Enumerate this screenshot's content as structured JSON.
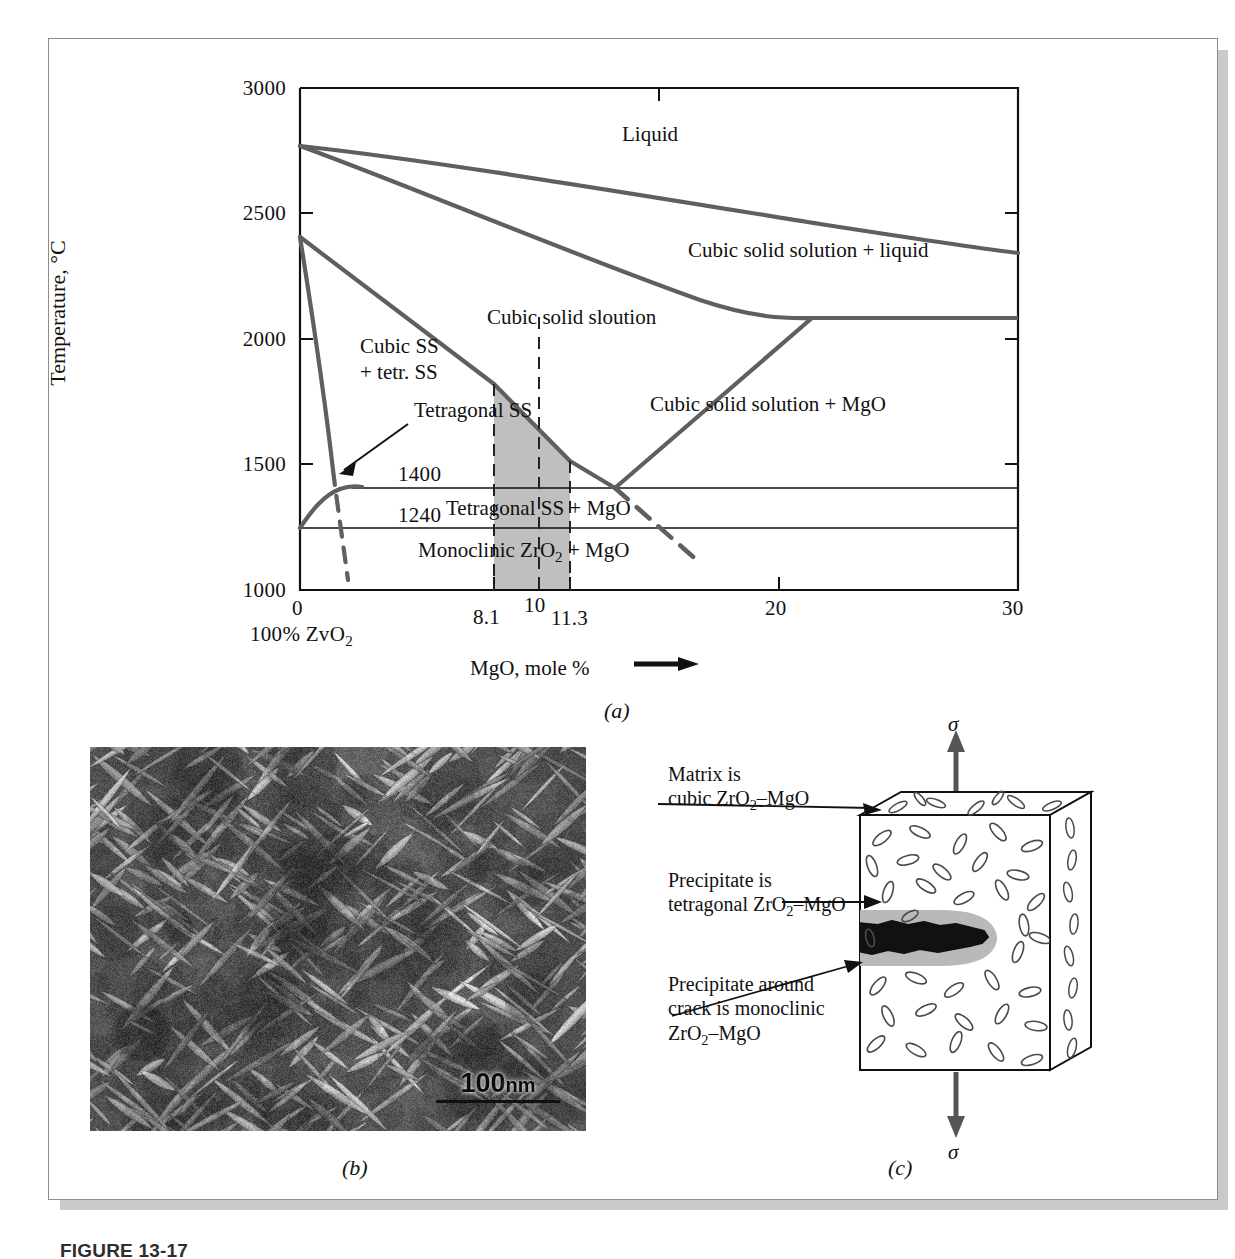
{
  "figure": {
    "caption_number": "FIGURE 13-17",
    "panel_tags": {
      "a": "(a)",
      "b": "(b)",
      "c": "(c)"
    }
  },
  "panel_a": {
    "name": "ZrO2-MgO phase diagram",
    "y_axis": {
      "title": "Temperature, °C",
      "ticks": [
        "3000",
        "2500",
        "2000",
        "1500",
        "1000"
      ],
      "min": 1000,
      "max": 3000
    },
    "x_axis": {
      "title": "MgO, mole %",
      "title_arrow": "⟶",
      "ticks": [
        "0",
        "8.1",
        "10",
        "11.3",
        "20",
        "30"
      ],
      "min": 0,
      "max": 30,
      "origin_note": "100% ZvO",
      "origin_note_sub": "2"
    },
    "horizontal_lines": [
      {
        "label": "1400",
        "temperature": 1400
      },
      {
        "label": "1240",
        "temperature": 1240
      }
    ],
    "field_labels": [
      "Liquid",
      "Cubic solid solution + liquid",
      "Cubic solid sloution",
      "Cubic SS",
      "+ tetr. SS",
      "Tetragonal SS",
      "Cubic solid solution + MgO",
      "Tetragonal SS + MgO"
    ],
    "monoclinic_label": {
      "pre": "Monoclinic ZrO",
      "sub": "2",
      "post": " + MgO"
    }
  },
  "chart_data": {
    "type": "line",
    "xlabel": "MgO, mole %",
    "ylabel": "Temperature, °C",
    "xlim": [
      0,
      30
    ],
    "ylim": [
      1000,
      3000
    ],
    "xticks": [
      0,
      8.1,
      10,
      11.3,
      20,
      30
    ],
    "yticks": [
      1000,
      1500,
      2000,
      2500,
      3000
    ],
    "grid": false,
    "legend": "none",
    "shaded_region": {
      "x_from": 8.1,
      "x_to": 11.3,
      "y_from": 1000,
      "color": "#bfbfbf"
    },
    "series": [
      {
        "name": "liquidus",
        "points": [
          [
            0,
            2770
          ],
          [
            8,
            2690
          ],
          [
            16,
            2570
          ],
          [
            23,
            2460
          ],
          [
            30,
            2390
          ]
        ]
      },
      {
        "name": "solidus (cubic ss + liquid)",
        "points": [
          [
            0,
            2770
          ],
          [
            7,
            2560
          ],
          [
            14,
            2330
          ],
          [
            21.4,
            2090
          ]
        ]
      },
      {
        "name": "eutectic horizontal 2090",
        "points": [
          [
            21.4,
            2090
          ],
          [
            30,
            2090
          ]
        ]
      },
      {
        "name": "cubic ss + MgO boundary",
        "points": [
          [
            21.4,
            2090
          ],
          [
            13.2,
            1400
          ]
        ]
      },
      {
        "name": "cubic solvus (tetragonal boundary)",
        "points": [
          [
            0,
            2370
          ],
          [
            4,
            2140
          ],
          [
            8.1,
            1790
          ],
          [
            11.3,
            1530
          ],
          [
            13.2,
            1400
          ]
        ]
      },
      {
        "name": "tetragonal/monoclinic dashed boundary",
        "points": [
          [
            0.9,
            2370
          ],
          [
            2.0,
            1530
          ],
          [
            2.6,
            1100
          ]
        ],
        "style": "dashed-lower"
      },
      {
        "name": "monoclinic dome",
        "points": [
          [
            0,
            1240
          ],
          [
            0.7,
            1330
          ],
          [
            1.5,
            1390
          ],
          [
            2.2,
            1400
          ]
        ]
      },
      {
        "name": "dashed boundary below eutectoid",
        "points": [
          [
            13.2,
            1400
          ],
          [
            16.4,
            1100
          ]
        ],
        "style": "dashed"
      },
      {
        "name": "isotherm 1400",
        "points": [
          [
            0,
            1400
          ],
          [
            30,
            1400
          ]
        ]
      },
      {
        "name": "isotherm 1240",
        "points": [
          [
            0,
            1240
          ],
          [
            30,
            1240
          ]
        ]
      }
    ]
  },
  "panel_b": {
    "name": "transmission electron micrograph",
    "scalebar": {
      "value": "100",
      "unit": "nm"
    }
  },
  "panel_c": {
    "name": "schematic of crack with transformed precipitate",
    "stress_symbol": "σ",
    "callouts": [
      {
        "line1": "Matrix is",
        "line2": "cubic ZrO",
        "sub": "2",
        "line2_end": "–MgO"
      },
      {
        "line1": "Precipitate is",
        "line2": "tetragonal ZrO",
        "sub": "2",
        "line2_end": "–MgO"
      },
      {
        "line1": "Precipitate around",
        "line2": "crack is monoclinic",
        "line3": "ZrO",
        "sub": "2",
        "line3_end": "–MgO"
      }
    ]
  },
  "colors": {
    "curve": "#5f5f5f",
    "axis": "#111111",
    "shade": "#bfbfbf",
    "precipitate_halo": "#b9b9b9",
    "plate_border": "#8d8d8d",
    "shadow": "#c9c9c9"
  }
}
